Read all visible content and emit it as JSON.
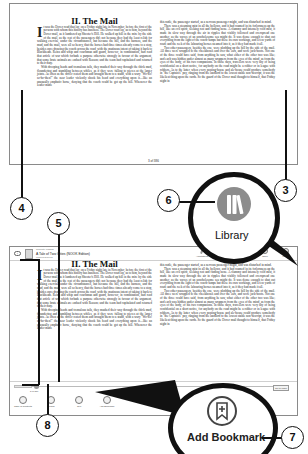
{
  "book": {
    "chapter_title": "II. The Mail",
    "dropcap": "I",
    "left_column": [
      "t was the Dover road that lay, on a Friday night late in November, before the first of the persons with whom this history has business. The Dover road lay, as to him, beyond the Dover mail, as it lumbered up Shooter's Hill. He walked up hill in the mire by the side of the mail, as the rest of the passengers did; not because they had the least relish for walking exercise, under the circumstances, but because the hill, and the harness, and the mud, and the mail, were all so heavy, that the horses had three times already come to a stop, besides once drawing the coach across the road, with the mutinous intent of taking it back to Blackheath. Reins and whip and coachman and guard, however, in combination, had read that article of war which forbade a purpose otherwise strongly in favour of the argument, that some brute animals are endued with Reason; and the team had capitulated and returned to their duty.",
      "With drooping heads and tremulous tails, they mashed their way through the thick mud, floundering and stumbling between whiles, as if they were falling to pieces at the larger joints. As often as the driver rested them and brought them to a stand, with a wary \"Wo-ho! so-ho-then!\" the near leader violently shook his head and everything upon it—like an unusually emphatic horse, denying that the coach could be got up the hill. Whenever the leader made"
    ],
    "right_column": [
      "this rattle, the passenger started, as a nervous passenger might, and was disturbed in mind.",
      "There was a steaming mist in all the hollows, and it had roamed in its forlornness up the hill, like an evil spirit, seeking rest and finding none. A clammy and intensely cold mist, it made its slow way through the air in ripples that visibly followed and overspread one another, as the waves of an unwholesome sea might do. It was dense enough to shut out everything from the light of the coach-lamps but these its own workings, and a few yards of road; and the reek of the labouring horses steamed into it, as if they had made it all.",
      "Two other passengers, besides the one, were plodding up the hill by the side of the mail. All three were wrapped to the cheekbones and over the ears, and wore jack-boots. Not one of the three could have said, from anything he saw, what either of the other two was like; and each was hidden under almost as many wrappers from the eyes of the mind, as from the eyes of the body, of his two companions. In those days, travellers were very shy of being confidential on a short notice, for anybody on the road might be a robber or in league with robbers. As to the latter, when every posting-house and ale-house could produce somebody in \"the Captain's\" pay, ranging from the landlord to the lowest stable non-descript, it was the likeliest thing upon the cards. So the guard of the Dover mail thought to himself, that Friday night in"
    ],
    "page_indicator": "3 of 386"
  },
  "header": {
    "back_label": "‹",
    "currently_reading_label": "Currently reading",
    "book_title": "A Tale of Two Cities (NOOK Edition)",
    "author": "Charles Dickens",
    "tools": [
      {
        "name": "annotations",
        "label": "Annotations"
      },
      {
        "name": "bookmarks",
        "label": "Bookmarks"
      },
      {
        "name": "home",
        "label": "Home"
      },
      {
        "name": "shop",
        "label": "Shop"
      },
      {
        "name": "library",
        "label": "Library"
      }
    ]
  },
  "footer": {
    "page_slider_label": "3 of 386",
    "goto_label": "Go to Page",
    "tools": [
      {
        "name": "table-of-contents",
        "label": "Table of Contents"
      },
      {
        "name": "search",
        "label": "Search"
      },
      {
        "name": "text",
        "label": "Text"
      },
      {
        "name": "add-bookmark",
        "label": "Add Bookmark"
      }
    ]
  },
  "magnifiers": {
    "library_label": "Library",
    "add_bookmark_label": "Add Bookmark"
  },
  "callouts": [
    "3",
    "4",
    "5",
    "6",
    "7",
    "8"
  ],
  "colors": {
    "callout_stroke": "#111111",
    "library_icon_fill": "#8c8c8c",
    "panel_border": "#8a8a8a"
  }
}
